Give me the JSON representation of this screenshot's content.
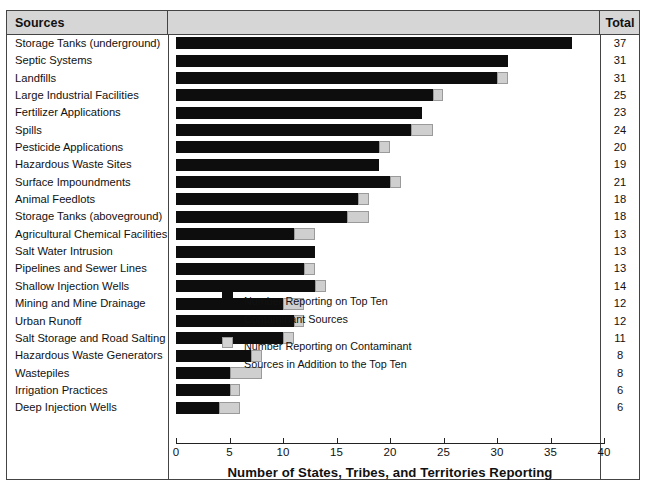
{
  "table": {
    "header": {
      "sources_label": "Sources",
      "total_label": "Total"
    }
  },
  "legend": {
    "position": "inside-plot",
    "items": [
      {
        "swatch": "black",
        "label": "Number Reporting on Top Ten Contaminant Sources"
      },
      {
        "swatch": "gray",
        "label": "Number Reporting on Contaminant Sources in Addition to the Top Ten"
      }
    ]
  },
  "colors": {
    "top_ten": "#0d0d0d",
    "additional": "#cfcfcf",
    "header_band": "#d6d6d6",
    "frame": "#444444"
  },
  "chart_data": {
    "type": "bar",
    "orientation": "horizontal",
    "stacked": true,
    "title": "",
    "xlabel": "Number of States, Tribes, and Territories Reporting",
    "ylabel": "Sources",
    "xlim": [
      0,
      40
    ],
    "xticks": [
      0,
      5,
      10,
      15,
      20,
      25,
      30,
      35,
      40
    ],
    "grid": false,
    "categories": [
      "Storage Tanks (underground)",
      "Septic Systems",
      "Landfills",
      "Large Industrial Facilities",
      "Fertilizer Applications",
      "Spills",
      "Pesticide Applications",
      "Hazardous Waste Sites",
      "Surface Impoundments",
      "Animal Feedlots",
      "Storage Tanks (aboveground)",
      "Agricultural Chemical Facilities",
      "Salt Water Intrusion",
      "Pipelines and Sewer Lines",
      "Shallow Injection Wells",
      "Mining and Mine Drainage",
      "Urban Runoff",
      "Salt Storage and Road Salting",
      "Hazardous Waste Generators",
      "Wastepiles",
      "Irrigation Practices",
      "Deep Injection Wells"
    ],
    "series": [
      {
        "name": "Number Reporting on Top Ten Contaminant Sources",
        "color": "#0d0d0d",
        "values": [
          37,
          31,
          30,
          24,
          23,
          22,
          19,
          19,
          20,
          17,
          16,
          11,
          13,
          12,
          13,
          10,
          11,
          10,
          7,
          5,
          5,
          4
        ]
      },
      {
        "name": "Number Reporting on Contaminant Sources in Addition to the Top Ten",
        "color": "#cfcfcf",
        "values": [
          0,
          0,
          1,
          1,
          0,
          2,
          1,
          0,
          1,
          1,
          2,
          2,
          0,
          1,
          1,
          2,
          1,
          1,
          1,
          3,
          1,
          2
        ]
      }
    ],
    "totals": [
      37,
      31,
      31,
      25,
      23,
      24,
      20,
      19,
      21,
      18,
      18,
      13,
      13,
      13,
      14,
      12,
      12,
      11,
      8,
      8,
      6,
      6
    ]
  }
}
